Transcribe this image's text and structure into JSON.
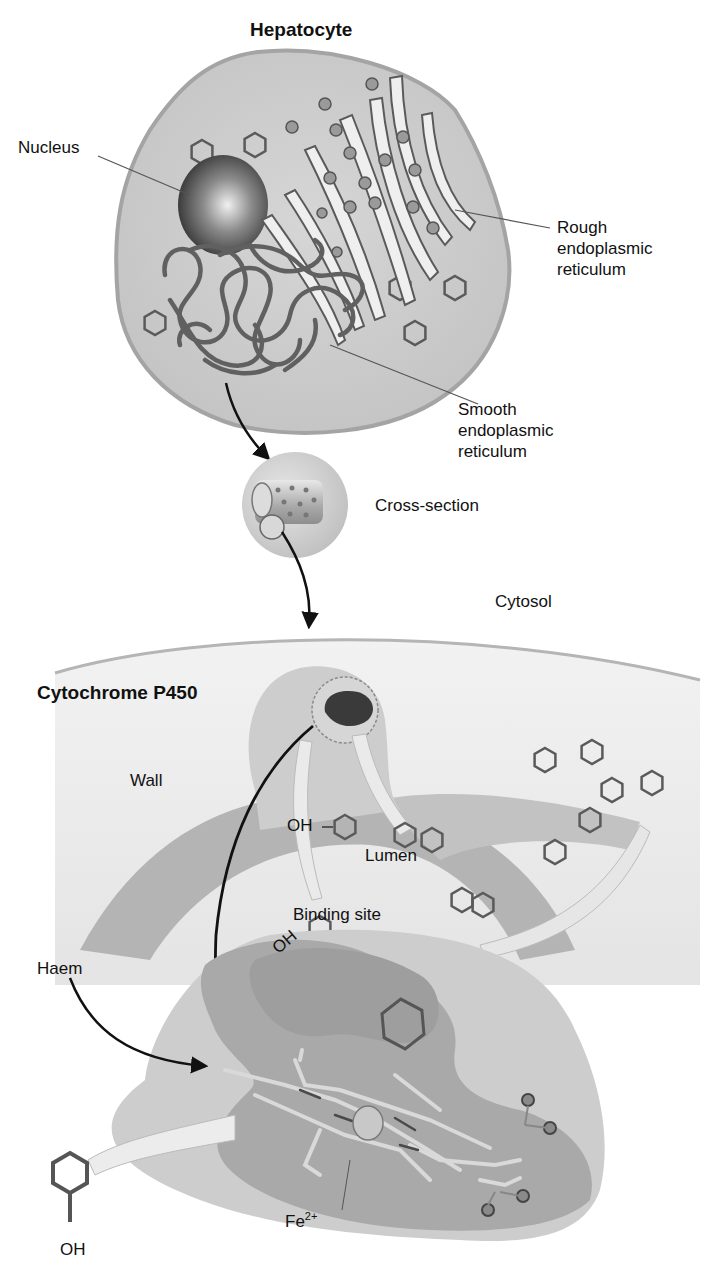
{
  "figure": {
    "title": "Hepatocyte",
    "labels": {
      "nucleus": "Nucleus",
      "rough_er": [
        "Rough",
        "endoplasmic",
        "reticulum"
      ],
      "smooth_er": [
        "Smooth",
        "endoplasmic",
        "reticulum"
      ],
      "cross_section": "Cross-section",
      "cytosol": "Cytosol",
      "cytochrome": "Cytochrome P450",
      "wall": "Wall",
      "lumen": "Lumen",
      "oh_upper": "OH",
      "oh_lower": "OH",
      "binding_site": "Binding site",
      "haem": "Haem",
      "fe_base": "Fe",
      "fe_charge": "2+",
      "oh_bottom": "OH"
    },
    "colors": {
      "cell_fill": "#c9c9c9",
      "cell_edge": "#9a9a9a",
      "organelle_stroke": "#555555",
      "nucleus_dark": "#3a3a3a",
      "membrane_fill": "#b8b8b8",
      "protein_light": "#d2d2d2",
      "protein_dark": "#9c9c9c",
      "arrow": "#111111"
    }
  }
}
